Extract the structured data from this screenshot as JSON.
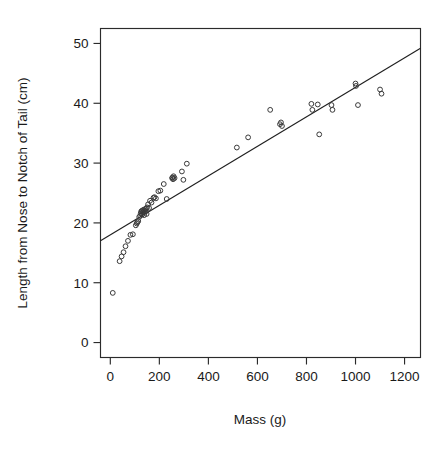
{
  "chart_data": {
    "type": "scatter",
    "title": "",
    "subtitle": "",
    "xlabel": "Mass (g)",
    "ylabel": "Length from Nose to Notch of Tail (cm)",
    "xlim": [
      -40,
      1265
    ],
    "ylim": [
      -2.5,
      52.5
    ],
    "xticks": [
      0,
      200,
      400,
      600,
      800,
      1000,
      1200
    ],
    "xtick_labels": [
      "0",
      "200",
      "400",
      "600",
      "800",
      "1000",
      "1200"
    ],
    "yticks": [
      0,
      10,
      20,
      30,
      40,
      50
    ],
    "ytick_labels": [
      "0",
      "10",
      "20",
      "30",
      "40",
      "50"
    ],
    "grid": false,
    "legend": null,
    "marker": "open-circle",
    "marker_radius_px": 2.4,
    "point_color": "#3a3a3a",
    "line_color": "#1f1f1f",
    "frame": "box",
    "series": [
      {
        "name": "Lizard mass vs length",
        "points": [
          [
            10,
            8.3
          ],
          [
            38,
            13.6
          ],
          [
            46,
            14.4
          ],
          [
            54,
            15.1
          ],
          [
            62,
            16.1
          ],
          [
            72,
            17.0
          ],
          [
            82,
            18.0
          ],
          [
            92,
            18.1
          ],
          [
            104,
            19.6
          ],
          [
            108,
            19.9
          ],
          [
            110,
            20.1
          ],
          [
            114,
            20.3
          ],
          [
            118,
            21.0
          ],
          [
            122,
            21.2
          ],
          [
            124,
            21.6
          ],
          [
            126,
            21.9
          ],
          [
            128,
            22.0
          ],
          [
            130,
            21.4
          ],
          [
            132,
            22.1
          ],
          [
            134,
            21.8
          ],
          [
            136,
            22.2
          ],
          [
            138,
            21.3
          ],
          [
            140,
            22.0
          ],
          [
            142,
            22.3
          ],
          [
            144,
            21.9
          ],
          [
            146,
            22.4
          ],
          [
            148,
            21.5
          ],
          [
            150,
            22.6
          ],
          [
            154,
            23.1
          ],
          [
            158,
            22.5
          ],
          [
            162,
            23.7
          ],
          [
            168,
            23.4
          ],
          [
            176,
            24.2
          ],
          [
            180,
            24.3
          ],
          [
            186,
            24.1
          ],
          [
            196,
            25.3
          ],
          [
            204,
            25.4
          ],
          [
            218,
            26.5
          ],
          [
            230,
            24.0
          ],
          [
            252,
            27.5
          ],
          [
            254,
            27.6
          ],
          [
            256,
            27.3
          ],
          [
            258,
            27.8
          ],
          [
            262,
            27.5
          ],
          [
            292,
            28.6
          ],
          [
            298,
            27.2
          ],
          [
            312,
            29.9
          ],
          [
            516,
            32.6
          ],
          [
            562,
            34.3
          ],
          [
            652,
            38.9
          ],
          [
            692,
            36.5
          ],
          [
            696,
            36.8
          ],
          [
            700,
            36.2
          ],
          [
            820,
            39.9
          ],
          [
            824,
            38.9
          ],
          [
            846,
            39.8
          ],
          [
            852,
            34.8
          ],
          [
            902,
            39.7
          ],
          [
            906,
            38.9
          ],
          [
            1000,
            43.3
          ],
          [
            1002,
            42.9
          ],
          [
            1010,
            39.7
          ],
          [
            1100,
            42.3
          ],
          [
            1106,
            41.6
          ]
        ]
      }
    ],
    "fit_line": {
      "name": "least-squares regression line",
      "x_start": -40,
      "y_start": 17.0,
      "x_end": 1265,
      "y_end": 49.2
    }
  },
  "axes": {
    "x_axis_name": "mass-axis",
    "y_axis_name": "length-axis"
  }
}
